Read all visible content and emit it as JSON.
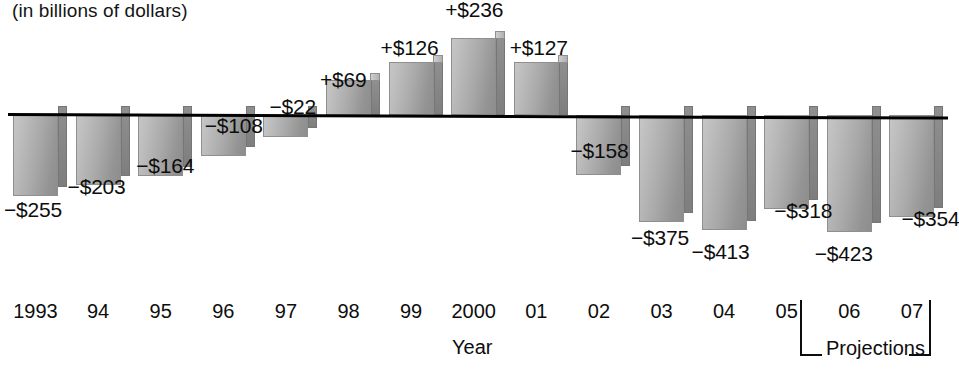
{
  "subtitle": "(in billions of dollars)",
  "axis": {
    "xlabel": "Year",
    "projections_label": "Projections"
  },
  "chart_data": {
    "type": "bar",
    "title": "",
    "subtitle": "(in billions of dollars)",
    "xlabel": "Year",
    "ylabel": "",
    "units": "billions of dollars",
    "grid": false,
    "legend": false,
    "zero_line": true,
    "categories": [
      "1993",
      "94",
      "95",
      "96",
      "97",
      "98",
      "99",
      "2000",
      "01",
      "02",
      "03",
      "04",
      "05",
      "06",
      "07"
    ],
    "values": [
      -255,
      -203,
      -164,
      -108,
      -22,
      69,
      126,
      236,
      127,
      -158,
      -375,
      -413,
      -318,
      -423,
      -354
    ],
    "labels": [
      "−$255",
      "−$203",
      "−$164",
      "−$108",
      "−$22",
      "+$69",
      "+$126",
      "+$236",
      "+$127",
      "−$158",
      "−$375",
      "−$413",
      "−$318",
      "−$423",
      "−$354"
    ],
    "projection_categories": [
      "06",
      "07"
    ],
    "bar_color": "#a9a9a9",
    "ylim": [
      -450,
      260
    ]
  },
  "bars": [
    {
      "year": "1993",
      "label": "−$255",
      "value": -255
    },
    {
      "year": "94",
      "label": "−$203",
      "value": -203
    },
    {
      "year": "95",
      "label": "−$164",
      "value": -164
    },
    {
      "year": "96",
      "label": "−$108",
      "value": -108
    },
    {
      "year": "97",
      "label": "−$22",
      "value": -22
    },
    {
      "year": "98",
      "label": "+$69",
      "value": 69
    },
    {
      "year": "99",
      "label": "+$126",
      "value": 126
    },
    {
      "year": "2000",
      "label": "+$236",
      "value": 236
    },
    {
      "year": "01",
      "label": "+$127",
      "value": 127
    },
    {
      "year": "02",
      "label": "−$158",
      "value": -158
    },
    {
      "year": "03",
      "label": "−$375",
      "value": -375
    },
    {
      "year": "04",
      "label": "−$413",
      "value": -413
    },
    {
      "year": "05",
      "label": "−$318",
      "value": -318
    },
    {
      "year": "06",
      "label": "−$423",
      "value": -423
    },
    {
      "year": "07",
      "label": "−$354",
      "value": -354
    }
  ]
}
